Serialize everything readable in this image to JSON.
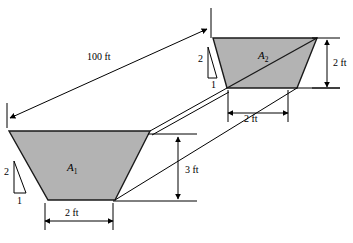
{
  "figure": {
    "type": "engineering-cross-section-diagram",
    "background_color": "#ffffff",
    "line_color": "#000000",
    "fill_color": "#b3b3b3",
    "caption_fragment": ""
  },
  "sections": {
    "a1": {
      "label": "A",
      "subscript": "1",
      "bottom_width": "2 ft",
      "side_slope_rise": "2",
      "side_slope_run": "1"
    },
    "a2": {
      "label": "A",
      "subscript": "2",
      "bottom_width": "2 ft",
      "depth": "2 ft",
      "side_slope_rise": "2",
      "side_slope_run": "1"
    }
  },
  "dimensions": {
    "reach_length": "100 ft",
    "elevation_drop": "3 ft",
    "a1_bottom_width": "2 ft",
    "a2_bottom_width": "2 ft",
    "a2_depth": "2 ft"
  },
  "slope_markers": {
    "left": {
      "rise": "2",
      "run": "1"
    },
    "right": {
      "rise": "2",
      "run": "1"
    }
  }
}
